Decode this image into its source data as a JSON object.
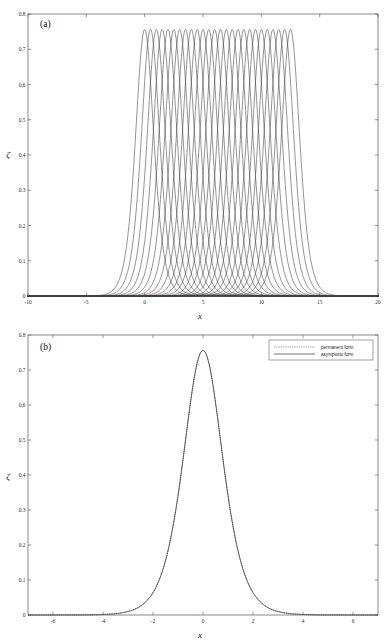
{
  "figure": {
    "panels": [
      {
        "tag": "(a)",
        "xlabel": "x",
        "ylabel": "ζ"
      },
      {
        "tag": "(b)",
        "xlabel": "x",
        "ylabel": "ζ"
      }
    ]
  },
  "legend": {
    "entries": [
      {
        "label": "permanent form",
        "style": "dotted"
      },
      {
        "label": "asymptotic form",
        "style": "solid"
      }
    ]
  },
  "chart_data": [
    {
      "type": "line",
      "panel": "(a)",
      "title": "",
      "xlabel": "x",
      "ylabel": "ζ",
      "xlim": [
        -10,
        20
      ],
      "ylim": [
        0,
        0.8
      ],
      "xticks": [
        -10,
        -5,
        0,
        5,
        10,
        15,
        20
      ],
      "xticklabels": [
        "-10",
        "-5",
        "0",
        "5",
        "10",
        "15",
        "20"
      ],
      "yticks": [
        0,
        0.1,
        0.2,
        0.3,
        0.4,
        0.5,
        0.6,
        0.7,
        0.8
      ],
      "yticklabels": [
        "0",
        "0.1",
        "0.2",
        "0.3",
        "0.4",
        "0.5",
        "0.6",
        "0.7",
        "0.8"
      ],
      "grid": false,
      "legend_position": "none",
      "description": "Train of overlapping soliton profiles of permanent form, each peaked at amplitude 0.756, with peak centres translated in steps of 0.5 from x = 0 to x = 12.5.",
      "series_family": {
        "name": "soliton-train",
        "count": 26,
        "peak_amplitude": 0.756,
        "peak_centres": [
          0,
          0.5,
          1,
          1.5,
          2,
          2.5,
          3,
          3.5,
          4,
          4.5,
          5,
          5.5,
          6,
          6.5,
          7,
          7.5,
          8,
          8.5,
          9,
          9.5,
          10,
          10.5,
          11,
          11.5,
          12,
          12.5
        ],
        "profile_halfwidth": 1.05,
        "profile_shape": "sech-squared-like peaked pulse with broad algebraic tails"
      },
      "sampled_profile": {
        "comment": "Single representative pulse centred at x=0 (same shape used for every member of the train).",
        "x": [
          -8,
          -7,
          -6,
          -5,
          -4.5,
          -4,
          -3.5,
          -3,
          -2.5,
          -2,
          -1.75,
          -1.5,
          -1.25,
          -1,
          -0.75,
          -0.5,
          -0.25,
          0,
          0.25,
          0.5,
          0.75,
          1,
          1.25,
          1.5,
          1.75,
          2,
          2.5,
          3,
          3.5,
          4,
          4.5,
          5,
          6,
          7,
          8
        ],
        "y": [
          0.002,
          0.003,
          0.006,
          0.012,
          0.018,
          0.027,
          0.041,
          0.063,
          0.098,
          0.158,
          0.203,
          0.262,
          0.336,
          0.424,
          0.522,
          0.621,
          0.707,
          0.756,
          0.707,
          0.621,
          0.522,
          0.424,
          0.336,
          0.262,
          0.203,
          0.158,
          0.098,
          0.063,
          0.041,
          0.027,
          0.018,
          0.012,
          0.006,
          0.003,
          0.002
        ]
      }
    },
    {
      "type": "line",
      "panel": "(b)",
      "title": "",
      "xlabel": "x",
      "ylabel": "ζ",
      "xlim": [
        -7,
        7
      ],
      "ylim": [
        0,
        0.8
      ],
      "xticks": [
        -6,
        -4,
        -2,
        0,
        2,
        4,
        6
      ],
      "xticklabels": [
        "-6",
        "-4",
        "-2",
        "0",
        "2",
        "4",
        "6"
      ],
      "yticks": [
        0,
        0.1,
        0.2,
        0.3,
        0.4,
        0.5,
        0.6,
        0.7,
        0.8
      ],
      "yticklabels": [
        "0",
        "0.1",
        "0.2",
        "0.3",
        "0.4",
        "0.5",
        "0.6",
        "0.7",
        "0.8"
      ],
      "grid": false,
      "legend_position": "upper right",
      "description": "Single peaked wave profile; the permanent-form (dotted) and asymptotic-form (solid) curves are visually indistinguishable.",
      "series": [
        {
          "name": "permanent form",
          "style": "dotted",
          "x": [
            -7,
            -6.5,
            -6,
            -5.5,
            -5,
            -4.5,
            -4,
            -3.5,
            -3,
            -2.75,
            -2.5,
            -2.25,
            -2,
            -1.75,
            -1.5,
            -1.25,
            -1,
            -0.75,
            -0.5,
            -0.25,
            0,
            0.25,
            0.5,
            0.75,
            1,
            1.25,
            1.5,
            1.75,
            2,
            2.25,
            2.5,
            2.75,
            3,
            3.5,
            4,
            4.5,
            5,
            5.5,
            6,
            6.5,
            7
          ],
          "y": [
            0.004,
            0.005,
            0.007,
            0.009,
            0.013,
            0.019,
            0.028,
            0.043,
            0.066,
            0.082,
            0.102,
            0.127,
            0.158,
            0.204,
            0.262,
            0.336,
            0.424,
            0.522,
            0.621,
            0.707,
            0.756,
            0.707,
            0.621,
            0.522,
            0.424,
            0.336,
            0.262,
            0.204,
            0.158,
            0.127,
            0.102,
            0.082,
            0.066,
            0.043,
            0.028,
            0.019,
            0.013,
            0.009,
            0.007,
            0.005,
            0.004
          ]
        },
        {
          "name": "asymptotic form",
          "style": "solid",
          "x": [
            -7,
            -6.5,
            -6,
            -5.5,
            -5,
            -4.5,
            -4,
            -3.5,
            -3,
            -2.75,
            -2.5,
            -2.25,
            -2,
            -1.75,
            -1.5,
            -1.25,
            -1,
            -0.75,
            -0.5,
            -0.25,
            0,
            0.25,
            0.5,
            0.75,
            1,
            1.25,
            1.5,
            1.75,
            2,
            2.25,
            2.5,
            2.75,
            3,
            3.5,
            4,
            4.5,
            5,
            5.5,
            6,
            6.5,
            7
          ],
          "y": [
            0.004,
            0.005,
            0.007,
            0.009,
            0.013,
            0.019,
            0.028,
            0.043,
            0.066,
            0.082,
            0.102,
            0.127,
            0.158,
            0.204,
            0.262,
            0.336,
            0.424,
            0.522,
            0.621,
            0.707,
            0.756,
            0.707,
            0.621,
            0.522,
            0.424,
            0.336,
            0.262,
            0.204,
            0.158,
            0.127,
            0.102,
            0.082,
            0.066,
            0.043,
            0.028,
            0.019,
            0.013,
            0.009,
            0.007,
            0.005,
            0.004
          ]
        }
      ]
    }
  ]
}
